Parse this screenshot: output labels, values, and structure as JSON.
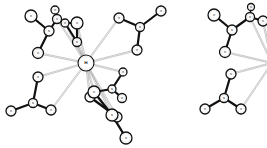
{
  "figure": {
    "background": "#ffffff",
    "colors": {
      "atom_stroke": "#111111",
      "atom_fill": "#ffffff",
      "covalent_bond": "#111111",
      "coordination_bond": "#9a9a9a",
      "label": "#222222"
    }
  },
  "molecules": [
    {
      "id": "left",
      "atoms": [
        {
          "id": "M",
          "x": 86,
          "y": 63,
          "r": 8,
          "label": "M",
          "big": true
        },
        {
          "id": "a1",
          "x": 31,
          "y": 16,
          "r": 6,
          "label": "O"
        },
        {
          "id": "a2",
          "x": 49,
          "y": 31,
          "r": 5,
          "label": "N"
        },
        {
          "id": "a3",
          "x": 38,
          "y": 53,
          "r": 5.5,
          "label": "O"
        },
        {
          "id": "a4",
          "x": 55,
          "y": 10,
          "r": 4,
          "label": "O"
        },
        {
          "id": "a5",
          "x": 57,
          "y": 19,
          "r": 4.5,
          "label": "O"
        },
        {
          "id": "a6",
          "x": 65,
          "y": 23,
          "r": 4,
          "label": "O"
        },
        {
          "id": "a7",
          "x": 77,
          "y": 23,
          "r": 6,
          "label": "O"
        },
        {
          "id": "a8",
          "x": 77,
          "y": 42,
          "r": 4.5,
          "label": "N"
        },
        {
          "id": "b1",
          "x": 119,
          "y": 18,
          "r": 5,
          "label": "O"
        },
        {
          "id": "b2",
          "x": 140,
          "y": 27,
          "r": 4.5,
          "label": "N"
        },
        {
          "id": "b3",
          "x": 137,
          "y": 50,
          "r": 5,
          "label": "O"
        },
        {
          "id": "b4",
          "x": 161,
          "y": 11,
          "r": 5,
          "label": "O"
        },
        {
          "id": "c1",
          "x": 38,
          "y": 77,
          "r": 5,
          "label": "O"
        },
        {
          "id": "c2",
          "x": 33,
          "y": 103,
          "r": 4.5,
          "label": "N"
        },
        {
          "id": "c3",
          "x": 11,
          "y": 111,
          "r": 5,
          "label": "O"
        },
        {
          "id": "c4",
          "x": 51,
          "y": 110,
          "r": 5,
          "label": "O"
        },
        {
          "id": "d1",
          "x": 123,
          "y": 72,
          "r": 4,
          "label": "O"
        },
        {
          "id": "d2",
          "x": 112,
          "y": 89,
          "r": 4,
          "label": "N"
        },
        {
          "id": "d3",
          "x": 122,
          "y": 98,
          "r": 4.5,
          "label": "O"
        },
        {
          "id": "d4",
          "x": 94,
          "y": 92,
          "r": 6,
          "label": "O"
        },
        {
          "id": "d5",
          "x": 90,
          "y": 97,
          "r": 5,
          "label": "O"
        },
        {
          "id": "e1",
          "x": 112,
          "y": 115,
          "r": 6,
          "label": "N"
        },
        {
          "id": "e2",
          "x": 117,
          "y": 117,
          "r": 5,
          "label": "O"
        },
        {
          "id": "e3",
          "x": 126,
          "y": 138,
          "r": 6,
          "label": "O"
        }
      ],
      "bonds": [
        {
          "from": "a1",
          "to": "a2",
          "type": "covalent",
          "w": 2.2
        },
        {
          "from": "a2",
          "to": "a3",
          "type": "covalent",
          "w": 2.2
        },
        {
          "from": "a2",
          "to": "a5",
          "type": "covalent",
          "w": 2.2
        },
        {
          "from": "a5",
          "to": "a4",
          "type": "covalent",
          "w": 1.2
        },
        {
          "from": "a5",
          "to": "a6",
          "type": "covalent",
          "w": 1.2
        },
        {
          "from": "a6",
          "to": "a7",
          "type": "covalent",
          "w": 2.2
        },
        {
          "from": "a7",
          "to": "a8",
          "type": "covalent",
          "w": 2.2
        },
        {
          "from": "a6",
          "to": "a8",
          "type": "covalent",
          "w": 2.2
        },
        {
          "from": "b1",
          "to": "b2",
          "type": "covalent",
          "w": 2.2
        },
        {
          "from": "b2",
          "to": "b3",
          "type": "covalent",
          "w": 2.2
        },
        {
          "from": "b2",
          "to": "b4",
          "type": "covalent",
          "w": 2.2
        },
        {
          "from": "c1",
          "to": "c2",
          "type": "covalent",
          "w": 2.2
        },
        {
          "from": "c2",
          "to": "c3",
          "type": "covalent",
          "w": 2.2
        },
        {
          "from": "c2",
          "to": "c4",
          "type": "covalent",
          "w": 2.2
        },
        {
          "from": "d1",
          "to": "d2",
          "type": "covalent",
          "w": 2.2
        },
        {
          "from": "d2",
          "to": "d3",
          "type": "covalent",
          "w": 2.2
        },
        {
          "from": "d2",
          "to": "d4",
          "type": "covalent",
          "w": 2.2
        },
        {
          "from": "d4",
          "to": "e1",
          "type": "covalent",
          "w": 2.4
        },
        {
          "from": "d5",
          "to": "e2",
          "type": "covalent",
          "w": 2.4
        },
        {
          "from": "e1",
          "to": "e3",
          "type": "covalent",
          "w": 2.4
        },
        {
          "from": "M",
          "to": "a3",
          "type": "coordination",
          "w": 1
        },
        {
          "from": "M",
          "to": "a6",
          "type": "coordination",
          "w": 1
        },
        {
          "from": "M",
          "to": "a7",
          "type": "coordination",
          "w": 1
        },
        {
          "from": "M",
          "to": "a8",
          "type": "coordination",
          "w": 1
        },
        {
          "from": "M",
          "to": "a5",
          "type": "coordination",
          "w": 1
        },
        {
          "from": "M",
          "to": "b1",
          "type": "coordination",
          "w": 1
        },
        {
          "from": "M",
          "to": "b3",
          "type": "coordination",
          "w": 1
        },
        {
          "from": "M",
          "to": "c1",
          "type": "coordination",
          "w": 1
        },
        {
          "from": "M",
          "to": "c4",
          "type": "coordination",
          "w": 1
        },
        {
          "from": "M",
          "to": "d1",
          "type": "coordination",
          "w": 1
        },
        {
          "from": "M",
          "to": "d4",
          "type": "coordination",
          "w": 1
        },
        {
          "from": "M",
          "to": "d5",
          "type": "coordination",
          "w": 1
        },
        {
          "from": "M",
          "to": "e1",
          "type": "coordination",
          "w": 1
        },
        {
          "from": "M",
          "to": "e2",
          "type": "coordination",
          "w": 1
        }
      ]
    },
    {
      "id": "right",
      "atoms": [
        {
          "id": "r_a1",
          "x": 214,
          "y": 15,
          "r": 6,
          "label": "O"
        },
        {
          "id": "r_a2",
          "x": 232,
          "y": 30,
          "r": 5,
          "label": "N"
        },
        {
          "id": "r_a3",
          "x": 225,
          "y": 52,
          "r": 5.5,
          "label": "O"
        },
        {
          "id": "r_a4",
          "x": 251,
          "y": 7,
          "r": 3.5,
          "label": "O"
        },
        {
          "id": "r_a5",
          "x": 250,
          "y": 17,
          "r": 4.5,
          "label": "O"
        },
        {
          "id": "r_a6",
          "x": 263,
          "y": 21,
          "r": 5,
          "label": "O"
        },
        {
          "id": "r_c1",
          "x": 231,
          "y": 74,
          "r": 5,
          "label": "O"
        },
        {
          "id": "r_c2",
          "x": 224,
          "y": 98,
          "r": 4.5,
          "label": "N"
        },
        {
          "id": "r_c3",
          "x": 205,
          "y": 109,
          "r": 5,
          "label": "O"
        },
        {
          "id": "r_c4",
          "x": 241,
          "y": 109,
          "r": 5,
          "label": "O"
        }
      ],
      "bonds": [
        {
          "from": "r_a1",
          "to": "r_a2",
          "type": "covalent",
          "w": 2.2
        },
        {
          "from": "r_a2",
          "to": "r_a3",
          "type": "covalent",
          "w": 2.2
        },
        {
          "from": "r_a2",
          "to": "r_a5",
          "type": "covalent",
          "w": 2.2
        },
        {
          "from": "r_a5",
          "to": "r_a4",
          "type": "covalent",
          "w": 1.2
        },
        {
          "from": "r_a5",
          "to": "r_a6",
          "type": "covalent",
          "w": 2.2
        },
        {
          "from": "r_c1",
          "to": "r_c2",
          "type": "covalent",
          "w": 2.2
        },
        {
          "from": "r_c2",
          "to": "r_c3",
          "type": "covalent",
          "w": 2.2
        },
        {
          "from": "r_c2",
          "to": "r_c4",
          "type": "covalent",
          "w": 2.2
        }
      ],
      "offscreen_coordination": [
        {
          "from": "r_a3",
          "to_x": 272,
          "to_y": 63
        },
        {
          "from": "r_a5",
          "to_x": 272,
          "to_y": 63
        },
        {
          "from": "r_a6",
          "to_x": 272,
          "to_y": 63
        },
        {
          "from": "r_c1",
          "to_x": 272,
          "to_y": 63
        },
        {
          "from": "r_c4",
          "to_x": 272,
          "to_y": 63
        }
      ]
    }
  ]
}
